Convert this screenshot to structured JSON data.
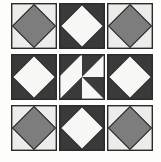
{
  "figure": {
    "name": "quilt-block-sampler",
    "background_color": "#fdfdfc",
    "rows": 3,
    "columns": 3,
    "block_size_px": 46
  },
  "palette": {
    "light_ground": "#ececeb",
    "dark_ground": "#3a3a3a",
    "medium_gray": "#7d7d7d",
    "white_patch": "#f7f7f5",
    "outline": "#2b2b2b",
    "page_background": "#ffffff"
  },
  "blocks": [
    {
      "position": "top-left",
      "name": "gray-diamond-on-light",
      "pattern": "square-in-a-square",
      "ground_color": "#ececeb",
      "diamond_color": "#7d7d7d",
      "outline_color": "#2b2b2b"
    },
    {
      "position": "top-center",
      "name": "white-diamond-on-dark",
      "pattern": "square-in-a-square",
      "ground_color": "#3a3a3a",
      "diamond_color": "#f7f7f5",
      "outline_color": "#2b2b2b"
    },
    {
      "position": "top-right",
      "name": "gray-diamond-on-light",
      "pattern": "square-in-a-square",
      "ground_color": "#ececeb",
      "diamond_color": "#7d7d7d",
      "outline_color": "#2b2b2b"
    },
    {
      "position": "middle-left",
      "name": "white-diamond-on-dark",
      "pattern": "square-in-a-square",
      "ground_color": "#3a3a3a",
      "diamond_color": "#f7f7f5",
      "outline_color": "#2b2b2b"
    },
    {
      "position": "center",
      "name": "pinwheel",
      "pattern": "pinwheel-eight-triangle",
      "ground_color": "#3a3a3a",
      "diamond_color": "#f7f7f5",
      "outline_color": "#2b2b2b"
    },
    {
      "position": "middle-right",
      "name": "white-diamond-on-dark",
      "pattern": "square-in-a-square",
      "ground_color": "#3a3a3a",
      "diamond_color": "#f7f7f5",
      "outline_color": "#2b2b2b"
    },
    {
      "position": "bottom-left",
      "name": "gray-diamond-on-light",
      "pattern": "square-in-a-square",
      "ground_color": "#ececeb",
      "diamond_color": "#7d7d7d",
      "outline_color": "#2b2b2b"
    },
    {
      "position": "bottom-center",
      "name": "white-diamond-on-dark",
      "pattern": "square-in-a-square",
      "ground_color": "#3a3a3a",
      "diamond_color": "#f7f7f5",
      "outline_color": "#2b2b2b"
    },
    {
      "position": "bottom-right",
      "name": "gray-diamond-on-light",
      "pattern": "square-in-a-square",
      "ground_color": "#ececeb",
      "diamond_color": "#7d7d7d",
      "outline_color": "#2b2b2b"
    }
  ]
}
